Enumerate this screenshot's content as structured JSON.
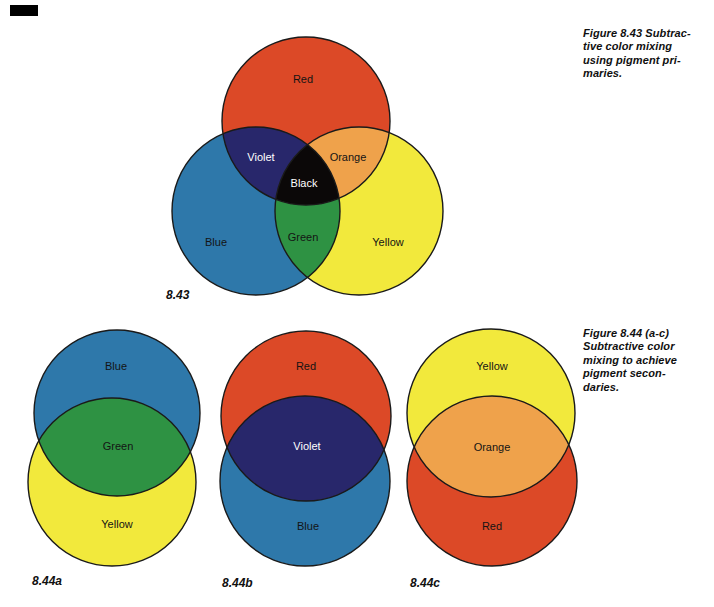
{
  "colors": {
    "red": "#DC4927",
    "blue": "#2E78AA",
    "yellow": "#F2E93C",
    "green": "#2E9243",
    "violet": "#28276B",
    "orange": "#EFA24B",
    "black": "#0B0808",
    "outline": "#1A1A1A",
    "label_dark": "#141414",
    "label_light": "#FFFFFF",
    "mark": "#000000"
  },
  "captions": {
    "fig843": {
      "lines": [
        "Figure 8.43 Subtrac-",
        "tive color mixing",
        "using pigment pri-",
        "maries."
      ]
    },
    "fig844": {
      "lines": [
        "Figure 8.44 (a-c)",
        "Subtractive color",
        "mixing to achieve",
        "pigment secon-",
        "daries."
      ]
    }
  },
  "fig843": {
    "number": "8.43",
    "labels": {
      "red": "Red",
      "violet": "Violet",
      "orange": "Orange",
      "black": "Black",
      "green": "Green",
      "blue": "Blue",
      "yellow": "Yellow"
    }
  },
  "fig844a": {
    "number": "8.44a",
    "labels": {
      "top": "Blue",
      "mix": "Green",
      "bottom": "Yellow"
    }
  },
  "fig844b": {
    "number": "8.44b",
    "labels": {
      "top": "Red",
      "mix": "Violet",
      "bottom": "Blue"
    }
  },
  "fig844c": {
    "number": "8.44c",
    "labels": {
      "top": "Yellow",
      "mix": "Orange",
      "bottom": "Red"
    }
  }
}
